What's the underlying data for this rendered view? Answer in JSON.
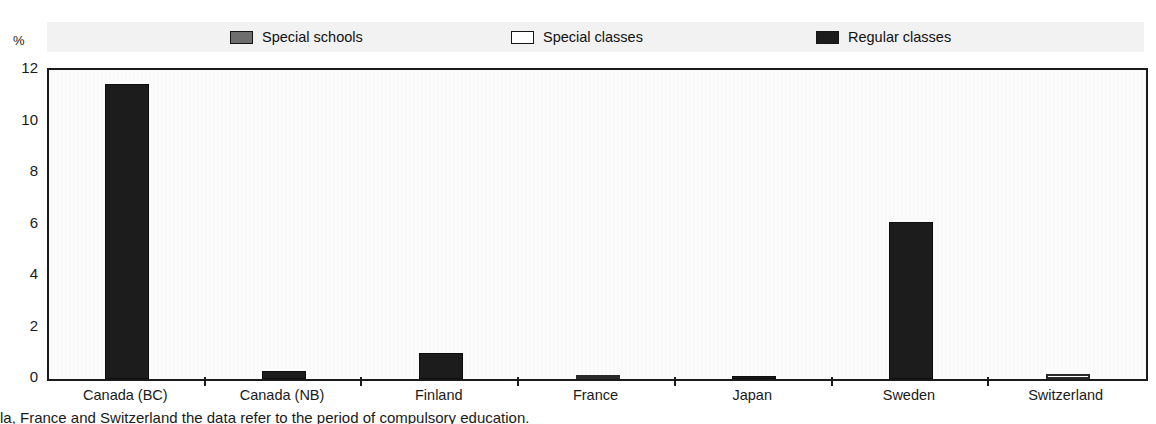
{
  "chart_data": {
    "type": "bar",
    "title": "",
    "subtitle": "",
    "xlabel": "",
    "ylabel": "",
    "unit_label": "%",
    "ylim": [
      0,
      12
    ],
    "yticks": [
      0,
      2,
      4,
      6,
      8,
      10,
      12
    ],
    "grid": false,
    "legend_position": "top",
    "categories": [
      "Canada (BC)",
      "Canada (NB)",
      "Finland",
      "France",
      "Japan",
      "Sweden",
      "Switzerland"
    ],
    "series": [
      {
        "name": "Special schools",
        "swatch_color": "#6e6e6e",
        "values": [
          null,
          null,
          null,
          null,
          null,
          null,
          null
        ]
      },
      {
        "name": "Special classes",
        "swatch_color": "#ffffff",
        "values": [
          null,
          null,
          null,
          0.15,
          null,
          null,
          0.2
        ]
      },
      {
        "name": "Regular classes",
        "swatch_color": "#1c1c1c",
        "values": [
          11.45,
          0.3,
          1.0,
          null,
          0.12,
          6.1,
          null
        ]
      }
    ],
    "plotted_bars": [
      {
        "category": "Canada (BC)",
        "series": "Regular classes",
        "value": 11.45
      },
      {
        "category": "Canada (NB)",
        "series": "Regular classes",
        "value": 0.3
      },
      {
        "category": "Finland",
        "series": "Regular classes",
        "value": 1.0
      },
      {
        "category": "France",
        "series": "Special classes",
        "value": 0.15
      },
      {
        "category": "Japan",
        "series": "Regular classes",
        "value": 0.12
      },
      {
        "category": "Sweden",
        "series": "Regular classes",
        "value": 6.1
      },
      {
        "category": "Switzerland",
        "series": "Special classes",
        "value": 0.2
      }
    ]
  },
  "legend": {
    "items": [
      {
        "label": "Special schools"
      },
      {
        "label": "Special classes"
      },
      {
        "label": "Regular classes"
      }
    ]
  },
  "axis": {
    "unit": "%",
    "y_labels": [
      "12",
      "10",
      "8",
      "6",
      "4",
      "2",
      "0"
    ],
    "x_labels": [
      "Canada (BC)",
      "Canada (NB)",
      "Finland",
      "France",
      "Japan",
      "Sweden",
      "Switzerland"
    ]
  },
  "caption": {
    "text": "la, France and Switzerland the data refer to the period of compulsory education."
  }
}
